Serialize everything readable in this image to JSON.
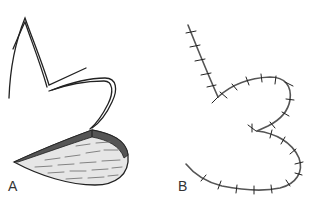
{
  "figure": {
    "panels": [
      {
        "id": "A",
        "label": "A",
        "description": "Flap outline incision with shaded flap"
      },
      {
        "id": "B",
        "label": "B",
        "description": "Sutured closure after flap transposition"
      }
    ],
    "colors": {
      "line": "#222222",
      "flap_fill": "#e6e6e6",
      "flap_hatch": "#555555",
      "suture_line": "#555555",
      "suture_ticks": "#222222"
    }
  }
}
